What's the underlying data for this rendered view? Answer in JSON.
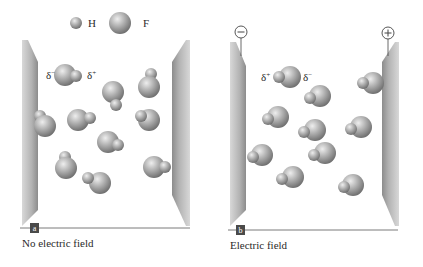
{
  "legend": {
    "hydrogen": {
      "symbol": "H",
      "x": 76,
      "y": 23,
      "r": 6
    },
    "fluorine": {
      "symbol": "F",
      "x": 120,
      "y": 23,
      "r": 11
    }
  },
  "panels": [
    {
      "id": "a",
      "badge": "a",
      "caption": "No electric field",
      "partial_charges": {
        "left": "δ",
        "left_sup": "−",
        "right": "δ",
        "right_sup": "+"
      },
      "molecules": [
        {
          "f": [
            65,
            75
          ],
          "h": [
            76,
            76
          ]
        },
        {
          "f": [
            113,
            92
          ],
          "h": [
            116,
            105
          ]
        },
        {
          "f": [
            149,
            87
          ],
          "h": [
            151,
            74
          ]
        },
        {
          "f": [
            45,
            126
          ],
          "h": [
            40,
            116
          ]
        },
        {
          "f": [
            78,
            120
          ],
          "h": [
            90,
            118
          ]
        },
        {
          "f": [
            149,
            120
          ],
          "h": [
            141,
            116
          ]
        },
        {
          "f": [
            108,
            142
          ],
          "h": [
            118,
            145
          ]
        },
        {
          "f": [
            66,
            168
          ],
          "h": [
            65,
            157
          ]
        },
        {
          "f": [
            100,
            183
          ],
          "h": [
            88,
            178
          ]
        },
        {
          "f": [
            154,
            167
          ],
          "h": [
            165,
            167
          ]
        }
      ]
    },
    {
      "id": "b",
      "badge": "b",
      "caption": "Electric field",
      "partial_charges": {
        "left": "δ",
        "left_sup": "+",
        "right": "δ",
        "right_sup": "−"
      },
      "electrodes": {
        "negative": "−",
        "positive": "+"
      },
      "molecules": [
        {
          "f": [
            290,
            77
          ],
          "h": [
            279,
            77
          ]
        },
        {
          "f": [
            320,
            96
          ],
          "h": [
            310,
            98
          ]
        },
        {
          "f": [
            373,
            83
          ],
          "h": [
            363,
            83
          ]
        },
        {
          "f": [
            278,
            117
          ],
          "h": [
            268,
            119
          ]
        },
        {
          "f": [
            315,
            130
          ],
          "h": [
            304,
            132
          ]
        },
        {
          "f": [
            361,
            127
          ],
          "h": [
            351,
            129
          ]
        },
        {
          "f": [
            262,
            155
          ],
          "h": [
            253,
            157
          ]
        },
        {
          "f": [
            325,
            153
          ],
          "h": [
            314,
            155
          ]
        },
        {
          "f": [
            293,
            177
          ],
          "h": [
            282,
            179
          ]
        },
        {
          "f": [
            353,
            185
          ],
          "h": [
            344,
            187
          ]
        }
      ]
    }
  ],
  "colors": {
    "sphere_light": "#e4e4e4",
    "sphere_mid": "#a9a9a9",
    "sphere_dark": "#6d6d6d",
    "plate_light": "#c9c9c9",
    "plate_dark": "#8f8f8f",
    "badge": "#4a4a4a",
    "rule": "#7a7a7a"
  }
}
